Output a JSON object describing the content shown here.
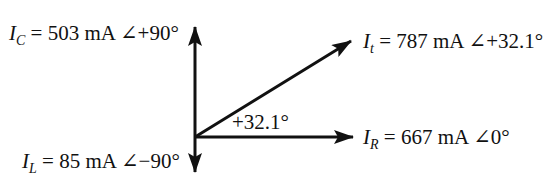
{
  "diagram": {
    "type": "phasor",
    "origin": {
      "x": 195,
      "y": 137
    },
    "phasors": [
      {
        "id": "IC",
        "symbol": "I",
        "subscript": "C",
        "magnitude": "503 mA",
        "angle": "+90°",
        "text": "= 503 mA ∠+90°",
        "tip": {
          "x": 195,
          "y": 25
        }
      },
      {
        "id": "It",
        "symbol": "I",
        "subscript": "t",
        "magnitude": "787 mA",
        "angle": "+32.1°",
        "text": "= 787 mA ∠+32.1°",
        "tip": {
          "x": 353,
          "y": 40
        }
      },
      {
        "id": "IR",
        "symbol": "I",
        "subscript": "R",
        "magnitude": "667 mA",
        "angle": "0°",
        "text": "= 667 mA ∠0°",
        "tip": {
          "x": 355,
          "y": 137
        }
      },
      {
        "id": "IL",
        "symbol": "I",
        "subscript": "L",
        "magnitude": "85 mA",
        "angle": "−90°",
        "text": "= 85 mA ∠−90°",
        "tip": {
          "x": 195,
          "y": 172
        }
      }
    ],
    "angle_annotation": "+32.1°",
    "stroke_color": "#111111"
  }
}
